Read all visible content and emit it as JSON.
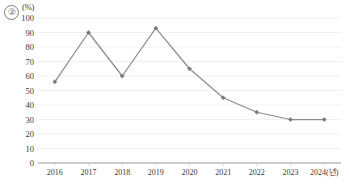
{
  "figure": {
    "index_label": "②",
    "unit_label": "(%)"
  },
  "chart_data": {
    "type": "line",
    "title": "",
    "subtitle": "",
    "xlabel": "",
    "ylabel": "(%)",
    "categories": [
      "2016",
      "2017",
      "2018",
      "2019",
      "2020",
      "2021",
      "2022",
      "2023",
      "2024(년)"
    ],
    "x": [
      2016,
      2017,
      2018,
      2019,
      2020,
      2021,
      2022,
      2023,
      2024
    ],
    "values": [
      56,
      90,
      60,
      93,
      65,
      45,
      35,
      30,
      30
    ],
    "series": [
      {
        "name": "",
        "values": [
          56,
          90,
          60,
          93,
          65,
          45,
          35,
          30,
          30
        ]
      }
    ],
    "ylim": [
      0,
      100
    ],
    "ytick_labels": [
      "0",
      "10",
      "20",
      "30",
      "40",
      "50",
      "60",
      "70",
      "80",
      "90",
      "100"
    ],
    "yticks": [
      0,
      10,
      20,
      30,
      40,
      50,
      60,
      70,
      80,
      90,
      100
    ],
    "xtick_labels": [
      "2016",
      "2017",
      "2018",
      "2019",
      "2020",
      "2021",
      "2022",
      "2023",
      "2024(년)"
    ],
    "grid": true,
    "grid_axis": "y",
    "legend": false,
    "legend_position": "none",
    "marker": "diamond",
    "line_color": "#8e8e8e",
    "marker_color": "#7c7c7c",
    "grid_color": "#ececec",
    "axis_color": "#9a9a9a"
  }
}
